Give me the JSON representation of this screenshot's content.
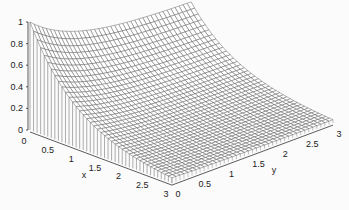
{
  "chart_data": {
    "type": "surface",
    "title": "",
    "xlabel": "x",
    "ylabel": "y",
    "zlabel": "",
    "x_ticks": [
      "0",
      "0.5",
      "1",
      "1.5",
      "2",
      "2.5",
      "3"
    ],
    "y_ticks": [
      "0",
      "0.5",
      "1",
      "1.5",
      "2",
      "2.5",
      "3"
    ],
    "z_ticks": [
      "0",
      "0.2",
      "0.4",
      "0.6",
      "0.8",
      "1"
    ],
    "xlim": [
      0,
      3
    ],
    "ylim": [
      0,
      3
    ],
    "zlim": [
      0,
      1
    ],
    "sample_points": [
      {
        "x": 0,
        "y": 0,
        "z": 1.0
      },
      {
        "x": 0.5,
        "y": 0,
        "z": 0.61
      },
      {
        "x": 1,
        "y": 0,
        "z": 0.37
      },
      {
        "x": 1.5,
        "y": 0,
        "z": 0.22
      },
      {
        "x": 2,
        "y": 0,
        "z": 0.14
      },
      {
        "x": 2.5,
        "y": 0,
        "z": 0.08
      },
      {
        "x": 3,
        "y": 0,
        "z": 0.05
      }
    ],
    "colors": {
      "mesh": "#555555",
      "fill": "#ffffff",
      "axis": "#333333"
    }
  }
}
